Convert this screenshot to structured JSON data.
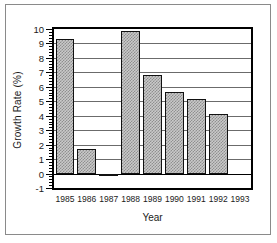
{
  "chart_data": {
    "type": "bar",
    "title": "",
    "xlabel": "Year",
    "ylabel": "Growth Rate (%)",
    "categories": [
      "1985",
      "1986",
      "1987",
      "1988",
      "1989",
      "1990",
      "1991",
      "1992",
      "1993"
    ],
    "values": [
      9.3,
      1.7,
      -0.2,
      9.85,
      6.8,
      5.65,
      5.15,
      4.15,
      null
    ],
    "ylim": [
      -1,
      10
    ],
    "xlim_labels": [
      "1985",
      "1993"
    ],
    "ytick_labels": [
      "-1",
      "0",
      "1",
      "2",
      "3",
      "4",
      "5",
      "6",
      "7",
      "8",
      "9",
      "10"
    ],
    "ytick_values": [
      -1,
      0,
      1,
      2,
      3,
      4,
      5,
      6,
      7,
      8,
      9,
      10
    ],
    "ytick_minor_step": 0.2,
    "grid": true,
    "grid_axis": "y",
    "legend": null,
    "legend_position": "none",
    "bar_fill": "#c9c9c9",
    "bar_pattern": "checkerboard-dither",
    "bar_edge_color": "#111111",
    "gridline_color": "#6b6b6b",
    "axis_color": "#000000",
    "background_color": "#ffffff",
    "note_1993_empty": true
  },
  "figure": {
    "frame_border_color": "#8a8a8a",
    "y_axis_title": "Growth Rate (%)",
    "x_axis_title": "Year"
  }
}
